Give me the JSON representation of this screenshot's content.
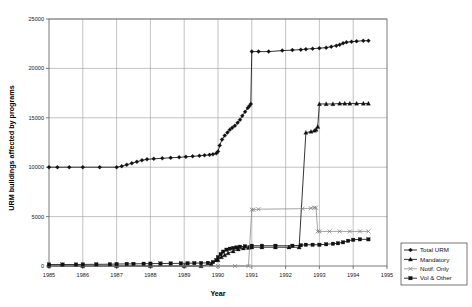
{
  "chart_data": {
    "type": "line",
    "title": "",
    "xlabel": "Year",
    "ylabel": "URM buildings affected by programs",
    "xlim": [
      1985,
      1995
    ],
    "ylim": [
      0,
      25000
    ],
    "xticks": [
      "1985",
      "1986",
      "1987",
      "1988",
      "1989",
      "1990",
      "1991",
      "1992",
      "1993",
      "1994",
      "1995"
    ],
    "yticks": [
      "0",
      "5000",
      "10000",
      "15000",
      "20000",
      "25000"
    ],
    "grid": true,
    "legend_position": "right-bottom",
    "series": [
      {
        "name": "Total URM",
        "marker": "diamond",
        "color": "#111111",
        "x": [
          1985.0,
          1985.25,
          1985.6,
          1986.0,
          1986.5,
          1987.0,
          1987.15,
          1987.3,
          1987.45,
          1987.6,
          1987.75,
          1987.9,
          1988.1,
          1988.35,
          1988.6,
          1988.85,
          1989.05,
          1989.25,
          1989.45,
          1989.6,
          1989.75,
          1989.85,
          1989.95,
          1990.0,
          1990.05,
          1990.12,
          1990.2,
          1990.28,
          1990.35,
          1990.42,
          1990.5,
          1990.58,
          1990.65,
          1990.72,
          1990.8,
          1990.88,
          1990.93,
          1990.97,
          1991.0,
          1991.2,
          1991.5,
          1991.9,
          1992.2,
          1992.45,
          1992.6,
          1992.8,
          1993.0,
          1993.2,
          1993.35,
          1993.5,
          1993.6,
          1993.7,
          1993.8,
          1993.95,
          1994.1,
          1994.3,
          1994.45
        ],
        "y": [
          10000,
          10000,
          10000,
          10000,
          10000,
          10000,
          10100,
          10250,
          10400,
          10550,
          10700,
          10800,
          10850,
          10900,
          10950,
          11000,
          11050,
          11100,
          11150,
          11200,
          11250,
          11300,
          11400,
          11600,
          12200,
          12800,
          13200,
          13500,
          13800,
          14000,
          14200,
          14500,
          14800,
          15200,
          15600,
          16000,
          16200,
          16400,
          21700,
          21700,
          21700,
          21800,
          21850,
          21900,
          21950,
          22000,
          22050,
          22100,
          22200,
          22300,
          22400,
          22550,
          22650,
          22700,
          22750,
          22800,
          22800
        ]
      },
      {
        "name": "Mandatory",
        "marker": "triangle",
        "color": "#111111",
        "x": [
          1985.0,
          1986.0,
          1987.0,
          1988.0,
          1989.0,
          1989.5,
          1989.8,
          1990.0,
          1990.1,
          1990.2,
          1990.3,
          1990.45,
          1990.6,
          1990.75,
          1990.9,
          1991.0,
          1991.3,
          1991.7,
          1992.1,
          1992.4,
          1992.6,
          1992.75,
          1992.85,
          1992.9,
          1992.95,
          1993.0,
          1993.2,
          1993.4,
          1993.6,
          1993.75,
          1993.9,
          1994.1,
          1994.3,
          1994.45
        ],
        "y": [
          0,
          0,
          0,
          0,
          0,
          0,
          200,
          600,
          900,
          1100,
          1300,
          1500,
          1700,
          1800,
          1850,
          1900,
          1900,
          1900,
          1900,
          1900,
          13500,
          13600,
          13700,
          13800,
          14100,
          16400,
          16400,
          16400,
          16450,
          16450,
          16450,
          16450,
          16450,
          16450
        ]
      },
      {
        "name": "Notif. Only",
        "marker": "x",
        "color": "#7d7d7d",
        "x": [
          1985.0,
          1986.0,
          1987.0,
          1988.0,
          1989.0,
          1990.0,
          1990.5,
          1990.9,
          1991.0,
          1991.05,
          1991.2,
          1992.5,
          1992.75,
          1992.85,
          1992.9,
          1992.95,
          1993.0,
          1993.3,
          1993.6,
          1993.9,
          1994.2,
          1994.45
        ],
        "y": [
          0,
          0,
          0,
          0,
          0,
          0,
          0,
          0,
          5700,
          5700,
          5750,
          5800,
          5850,
          5900,
          5900,
          3500,
          3500,
          3500,
          3500,
          3500,
          3500,
          3500
        ]
      },
      {
        "name": "Vol & Other",
        "marker": "square",
        "color": "#111111",
        "x": [
          1985.0,
          1985.4,
          1985.8,
          1986.0,
          1986.4,
          1986.8,
          1987.0,
          1987.3,
          1987.5,
          1987.8,
          1988.0,
          1988.3,
          1988.6,
          1988.9,
          1989.1,
          1989.3,
          1989.5,
          1989.7,
          1989.85,
          1989.95,
          1990.0,
          1990.08,
          1990.15,
          1990.25,
          1990.35,
          1990.45,
          1990.55,
          1990.65,
          1990.8,
          1991.0,
          1991.3,
          1991.7,
          1992.2,
          1992.45,
          1992.6,
          1992.8,
          1993.0,
          1993.2,
          1993.4,
          1993.55,
          1993.7,
          1993.85,
          1994.0,
          1994.2,
          1994.45
        ],
        "y": [
          150,
          150,
          150,
          160,
          170,
          180,
          200,
          210,
          220,
          230,
          240,
          250,
          260,
          270,
          280,
          290,
          300,
          320,
          400,
          600,
          900,
          1200,
          1450,
          1650,
          1750,
          1820,
          1880,
          1950,
          2000,
          2050,
          2050,
          2050,
          2050,
          2100,
          2150,
          2150,
          2150,
          2200,
          2250,
          2300,
          2400,
          2550,
          2650,
          2700,
          2700
        ]
      }
    ]
  }
}
